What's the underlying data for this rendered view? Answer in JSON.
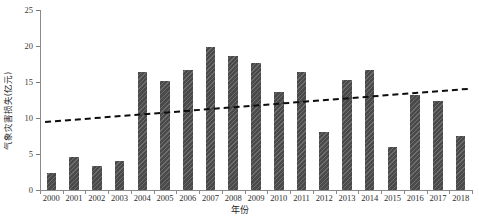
{
  "chart_data": {
    "type": "bar",
    "title": "",
    "xlabel": "年份",
    "ylabel": "气象灾害损失(亿元)",
    "categories": [
      "2000",
      "2001",
      "2002",
      "2003",
      "2004",
      "2005",
      "2006",
      "2007",
      "2008",
      "2009",
      "2010",
      "2011",
      "2012",
      "2013",
      "2014",
      "2015",
      "2016",
      "2017",
      "2018"
    ],
    "values": [
      2.3,
      4.6,
      3.3,
      4.0,
      16.4,
      15.2,
      16.7,
      19.8,
      18.6,
      17.7,
      13.6,
      16.4,
      8.1,
      15.3,
      16.6,
      6.0,
      13.2,
      12.3,
      7.5
    ],
    "series": [
      {
        "name": "气象灾害损失",
        "type": "bar",
        "values": [
          2.3,
          4.6,
          3.3,
          4.0,
          16.4,
          15.2,
          16.7,
          19.8,
          18.6,
          17.7,
          13.6,
          16.4,
          8.1,
          15.3,
          16.6,
          6.0,
          13.2,
          12.3,
          7.5
        ]
      },
      {
        "name": "线性趋势线",
        "type": "line",
        "style": "dashed",
        "values": [
          9.6,
          9.86,
          10.11,
          10.37,
          10.62,
          10.88,
          11.13,
          11.39,
          11.64,
          11.9,
          12.16,
          12.41,
          12.67,
          12.92,
          13.18,
          13.43,
          13.69,
          13.94,
          14.2
        ]
      }
    ],
    "ylim": [
      0,
      25
    ],
    "yticks": [
      0,
      5,
      10,
      15,
      20,
      25
    ],
    "ytick_labels": [
      "0",
      "5",
      "10",
      "15",
      "20",
      "25"
    ],
    "grid": false,
    "legend": "none",
    "bar_color": "#4a4a4a",
    "bar_pattern": "diagonal-hatch",
    "trendline_color": "#0d0d0d",
    "background_color": "#ffffff"
  },
  "watermark": {
    "text": "·"
  }
}
